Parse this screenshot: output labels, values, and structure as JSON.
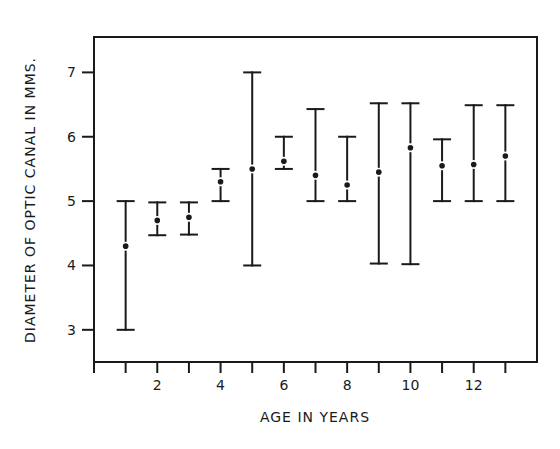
{
  "chart_data": {
    "type": "errorbar",
    "title": "",
    "xlabel": "AGE IN YEARS",
    "ylabel": "DIAMETER OF OPTIC CANAL IN MMS.",
    "xlim": [
      0,
      14
    ],
    "ylim": [
      2.5,
      7.55
    ],
    "xticks": [
      1,
      2,
      3,
      4,
      5,
      6,
      7,
      8,
      9,
      10,
      11,
      12,
      13
    ],
    "xtick_labels": [
      "",
      "2",
      "",
      "4",
      "",
      "6",
      "",
      "8",
      "",
      "10",
      "",
      "12",
      ""
    ],
    "yticks": [
      3,
      4,
      5,
      6,
      7
    ],
    "ytick_labels": [
      "3",
      "4",
      "5",
      "6",
      "7"
    ],
    "grid": false,
    "legend": null,
    "series": [
      {
        "name": "Optic canal diameter",
        "x": [
          1,
          2,
          3,
          4,
          5,
          6,
          7,
          8,
          9,
          10,
          11,
          12,
          13
        ],
        "mean": [
          4.3,
          4.7,
          4.75,
          5.3,
          5.5,
          5.62,
          5.4,
          5.25,
          5.45,
          5.83,
          5.55,
          5.57,
          5.7
        ],
        "min": [
          3.0,
          4.47,
          4.48,
          5.0,
          4.0,
          5.5,
          5.0,
          5.0,
          4.03,
          4.02,
          5.0,
          5.0,
          5.0
        ],
        "max": [
          5.0,
          4.98,
          4.98,
          5.5,
          7.0,
          6.0,
          6.43,
          6.0,
          6.52,
          6.52,
          5.96,
          6.49,
          6.49
        ]
      }
    ]
  },
  "colors": {
    "ink": "#1a1a1a",
    "background": "#ffffff"
  }
}
